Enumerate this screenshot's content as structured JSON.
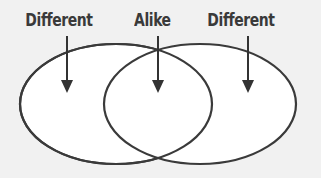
{
  "diagram": {
    "type": "venn",
    "labels": [
      {
        "text": "Different",
        "points_to": "left-only region"
      },
      {
        "text": "Alike",
        "points_to": "overlap region"
      },
      {
        "text": "Different",
        "points_to": "right-only region"
      }
    ],
    "colors": {
      "stroke": "#3a3a3a",
      "fill": "#ffffff",
      "background": "#f1f1f1"
    }
  }
}
